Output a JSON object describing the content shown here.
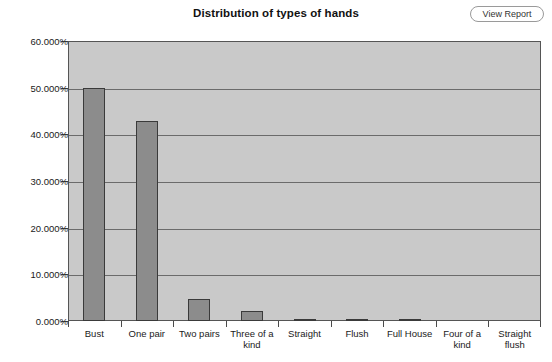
{
  "header": {
    "title": "Distribution of types of hands",
    "view_report_label": "View Report"
  },
  "chart_data": {
    "type": "bar",
    "title": "Distribution of types of hands",
    "xlabel": "",
    "ylabel": "",
    "ylim": [
      0,
      60
    ],
    "yticks": [
      0,
      10,
      20,
      30,
      40,
      50,
      60
    ],
    "ytick_labels": [
      "0.000%",
      "10.000%",
      "20.000%",
      "30.000%",
      "40.000%",
      "50.000%",
      "60.000%"
    ],
    "grid": true,
    "legend": false,
    "unit": "%",
    "categories": [
      "Bust",
      "One pair",
      "Two pairs",
      "Three of a kind",
      "Straight",
      "Flush",
      "Full House",
      "Four of a kind",
      "Straight flush"
    ],
    "values": [
      50.0,
      42.8,
      4.8,
      2.1,
      0.4,
      0.2,
      0.2,
      0.0,
      0.0
    ],
    "bar_color": "#8c8c8c",
    "bar_edge_color": "#3a3a3a",
    "plot_background": "#c9c9c9",
    "gridline_color": "#6b6b6b",
    "page_background": "#ffffff"
  }
}
